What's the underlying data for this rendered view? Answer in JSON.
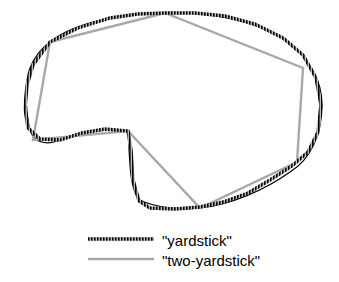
{
  "diagram": {
    "curve_color": "#000000",
    "yardstick_color": "#111111",
    "two_yardstick_color": "#a8a8a8"
  },
  "legend": {
    "items": [
      {
        "label": "\"yardstick\"",
        "style": "hatched-black"
      },
      {
        "label": "\"two-yardstick\"",
        "style": "gray"
      }
    ]
  }
}
